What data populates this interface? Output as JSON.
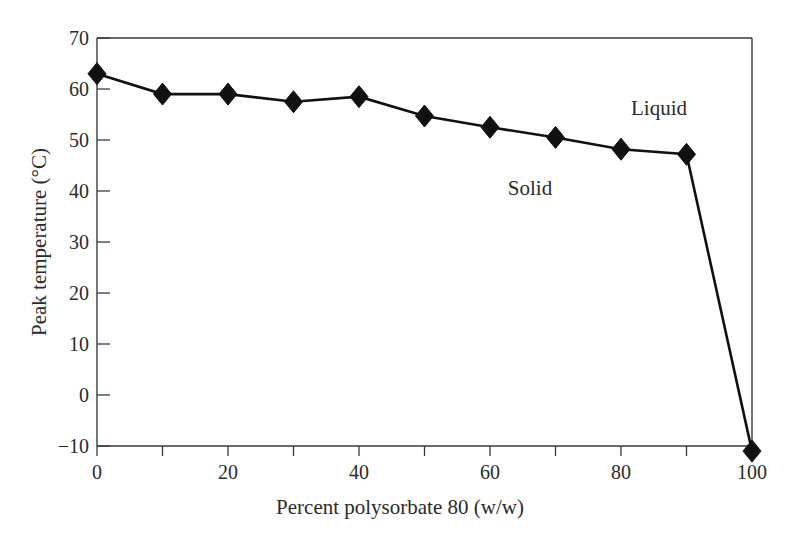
{
  "chart_data": {
    "type": "line",
    "title": "",
    "xlabel": "Percent polysorbate 80 (w/w)",
    "ylabel": "Peak temperature (°C)",
    "xlim": [
      0,
      100
    ],
    "ylim": [
      -10,
      70
    ],
    "xticks": [
      0,
      10,
      20,
      30,
      40,
      50,
      60,
      70,
      80,
      90,
      100
    ],
    "xtick_labels": [
      "0",
      "",
      "20",
      "",
      "40",
      "",
      "60",
      "",
      "80",
      "",
      "100"
    ],
    "yticks": [
      -10,
      0,
      10,
      20,
      30,
      40,
      50,
      60,
      70
    ],
    "ytick_labels": [
      "−10",
      "0",
      "10",
      "20",
      "30",
      "40",
      "50",
      "60",
      "70"
    ],
    "grid": false,
    "legend": "none",
    "marker": "diamond",
    "x": [
      0,
      10,
      20,
      30,
      40,
      50,
      60,
      70,
      80,
      90,
      100
    ],
    "values": [
      63.0,
      59.0,
      59.0,
      57.5,
      58.5,
      54.7,
      52.5,
      50.5,
      48.2,
      47.2,
      -11.0
    ],
    "series": [
      {
        "name": "Peak temperature",
        "values": [
          63.0,
          59.0,
          59.0,
          57.5,
          58.5,
          54.7,
          52.5,
          50.5,
          48.2,
          47.2,
          -11.0
        ]
      }
    ],
    "annotations": [
      {
        "text": "Solid",
        "x": 66,
        "y": 33
      },
      {
        "text": "Liquid",
        "x": 85.5,
        "y": 56
      }
    ],
    "line_color": "#111111",
    "marker_color": "#111111",
    "axis_color": "#3a3a3a",
    "background": "#ffffff"
  }
}
